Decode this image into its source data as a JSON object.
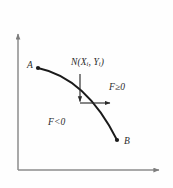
{
  "figure": {
    "kind": "coordinate-diagram",
    "background_color": "#fefefe",
    "axis_color": "#8c8c8c",
    "curve_color": "#1a1a1a",
    "label_color": "#2b2b2b",
    "axes": {
      "vertical_axis_name": "y-axis",
      "horizontal_axis_name": "x-axis",
      "origin": {
        "x": 18,
        "y": 170
      },
      "vertical_top": {
        "x": 18,
        "y": 32
      },
      "horizontal_right": {
        "x": 162,
        "y": 170
      },
      "has_arrowheads": true
    },
    "curve": {
      "name": "boundary-curve",
      "start_point": {
        "x": 38,
        "y": 68
      },
      "control_point": {
        "x": 86,
        "y": 80
      },
      "end_point": {
        "x": 117,
        "y": 140
      },
      "concavity": "down"
    },
    "points": [
      {
        "label": "A",
        "x": 38,
        "y": 68,
        "label_position": "left"
      },
      {
        "label": "B",
        "x": 117,
        "y": 140,
        "label_position": "right"
      }
    ],
    "node": {
      "label_text": "N(X",
      "sub_i_first": "i",
      "label_mid": ", Y",
      "sub_i_second": "i",
      "label_close": ")",
      "full_label": "N(Xi, Yi)",
      "anchor": {
        "x": 80,
        "y": 103
      },
      "vertical_arrow": {
        "from_x": 80,
        "from_y": 75,
        "to_x": 80,
        "to_y": 103,
        "direction": "down"
      },
      "horizontal_arrow": {
        "from_x": 80,
        "from_y": 103,
        "to_x": 112,
        "to_y": 103,
        "direction": "right"
      }
    },
    "regions": [
      {
        "name": "upper-right-region",
        "label": "F≥0",
        "x": 109,
        "y": 83
      },
      {
        "name": "lower-left-region",
        "label": "F<0",
        "x": 48,
        "y": 118
      }
    ]
  }
}
